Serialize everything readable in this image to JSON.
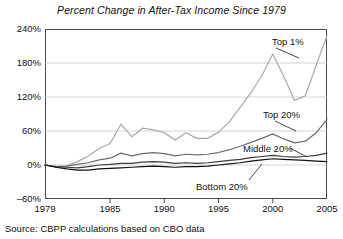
{
  "chart_data": {
    "type": "line",
    "title": "Percent Change in After-Tax Income Since 1979",
    "subtitle": "",
    "xlabel": "",
    "ylabel": "",
    "xlim": [
      1979,
      2005
    ],
    "ylim": [
      -60,
      240
    ],
    "yticks": [
      -60,
      0,
      60,
      120,
      180,
      240
    ],
    "ytick_labels": [
      "‒60%",
      "0%",
      "60%",
      "120%",
      "180%",
      "240%"
    ],
    "xticks": [
      1979,
      1985,
      1990,
      1995,
      2000,
      2005
    ],
    "xtick_labels": [
      "1979",
      "1985",
      "1990",
      "1995",
      "2000",
      "2005"
    ],
    "grid": "horizontal",
    "legend_position": "inline-annotations",
    "x": [
      1979,
      1980,
      1981,
      1982,
      1983,
      1984,
      1985,
      1986,
      1987,
      1988,
      1989,
      1990,
      1991,
      1992,
      1993,
      1994,
      1995,
      1996,
      1997,
      1998,
      1999,
      2000,
      2001,
      2002,
      2003,
      2004,
      2005
    ],
    "series": [
      {
        "name": "Top 1%",
        "color": "#a8a8a8",
        "values": [
          0,
          -4,
          -2,
          6,
          16,
          29,
          38,
          72,
          50,
          65,
          62,
          57,
          44,
          57,
          47,
          47,
          58,
          76,
          102,
          128,
          158,
          196,
          157,
          114,
          122,
          176,
          228
        ]
      },
      {
        "name": "Top 20%",
        "color": "#6e6e6e",
        "values": [
          0,
          -3,
          -2,
          1,
          4,
          9,
          12,
          21,
          16,
          20,
          22,
          20,
          16,
          19,
          18,
          19,
          22,
          27,
          33,
          40,
          47,
          55,
          46,
          39,
          42,
          57,
          80
        ]
      },
      {
        "name": "Middle 20%",
        "color": "#3c3c3c",
        "values": [
          0,
          -3,
          -4,
          -5,
          -3,
          0,
          1,
          3,
          3,
          5,
          6,
          5,
          3,
          4,
          3,
          4,
          6,
          8,
          10,
          13,
          15,
          17,
          15,
          14,
          15,
          17,
          21
        ]
      },
      {
        "name": "Bottom 20%",
        "color": "#111111",
        "values": [
          0,
          -4,
          -7,
          -9,
          -9,
          -7,
          -6,
          -5,
          -4,
          -3,
          -2,
          -3,
          -4,
          -3,
          -3,
          -2,
          0,
          2,
          4,
          7,
          9,
          11,
          10,
          9,
          8,
          7,
          6
        ]
      }
    ],
    "annotations": [
      {
        "text": "Top 1%",
        "label_x": 272,
        "label_y": 36,
        "leader": {
          "x1": 276,
          "y1": 48,
          "x2": 299,
          "y2": 58
        }
      },
      {
        "text": "Top 20%",
        "label_x": 263,
        "label_y": 109,
        "leader": {
          "x1": 275,
          "y1": 121,
          "x2": 296,
          "y2": 131
        }
      },
      {
        "text": "Middle 20%",
        "label_x": 243,
        "label_y": 143,
        "leader": {
          "x1": 290,
          "y1": 148,
          "x2": 307,
          "y2": 157
        }
      },
      {
        "text": "Bottom 20%",
        "label_x": 196,
        "label_y": 181,
        "leader": {
          "x1": 249,
          "y1": 180,
          "x2": 262,
          "y2": 164
        }
      }
    ]
  },
  "source": {
    "note": "Source: CBPP calculations based on CBO data"
  },
  "colors": {
    "background": "#ffffff",
    "axis": "#4a4a4a",
    "grid": "#c9c9c9",
    "text": "#111111"
  }
}
